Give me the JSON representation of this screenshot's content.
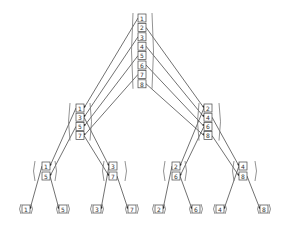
{
  "diagram": {
    "title": "",
    "type": "bit-reversal permutation tree",
    "levels": [
      {
        "name": "root",
        "groups": [
          {
            "items": [
              "1",
              "2",
              "3",
              "4",
              "5",
              "6",
              "7",
              "8"
            ]
          }
        ]
      },
      {
        "name": "level-2",
        "groups": [
          {
            "items": [
              "1",
              "3",
              "5",
              "7"
            ]
          },
          {
            "items": [
              "2",
              "4",
              "6",
              "8"
            ]
          }
        ]
      },
      {
        "name": "level-3",
        "groups": [
          {
            "items": [
              "1",
              "5"
            ]
          },
          {
            "items": [
              "3",
              "7"
            ]
          },
          {
            "items": [
              "2",
              "6"
            ]
          },
          {
            "items": [
              "4",
              "8"
            ]
          }
        ]
      },
      {
        "name": "leaves",
        "groups": [
          {
            "items": [
              "1"
            ]
          },
          {
            "items": [
              "5"
            ]
          },
          {
            "items": [
              "3"
            ]
          },
          {
            "items": [
              "7"
            ]
          },
          {
            "items": [
              "2"
            ]
          },
          {
            "items": [
              "6"
            ]
          },
          {
            "items": [
              "4"
            ]
          },
          {
            "items": [
              "8"
            ]
          }
        ]
      }
    ],
    "colors": {
      "line": "#333333",
      "bracket": "#777777",
      "background": "#ffffff"
    }
  }
}
